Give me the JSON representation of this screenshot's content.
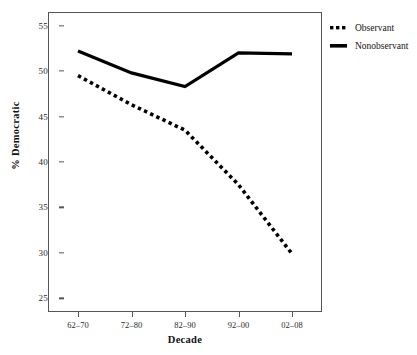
{
  "chart_data": {
    "type": "line",
    "title": "",
    "xlabel": "Decade",
    "ylabel": "% Democratic",
    "categories": [
      "62–70",
      "72–80",
      "82–90",
      "92–00",
      "02–08"
    ],
    "ylim": [
      23.5,
      56.5
    ],
    "yticks": [
      25,
      30,
      35,
      40,
      45,
      50,
      55
    ],
    "ytick_labels": [
      "25",
      "30",
      "35",
      "40",
      "45",
      "50",
      "55"
    ],
    "grid": false,
    "legend_position": "right-top",
    "series": [
      {
        "name": "Observant",
        "style": "dotted",
        "color": "#000000",
        "values": [
          49.5,
          46.3,
          43.5,
          37.5,
          29.9
        ]
      },
      {
        "name": "Nonobservant",
        "style": "solid",
        "color": "#000000",
        "values": [
          52.2,
          49.8,
          48.3,
          52.0,
          51.9
        ]
      }
    ]
  },
  "legend": {
    "items": [
      {
        "label": "Observant",
        "style": "dotted"
      },
      {
        "label": "Nonobservant",
        "style": "solid"
      }
    ]
  },
  "axes": {
    "x_title": "Decade",
    "y_title": "% Democratic"
  }
}
